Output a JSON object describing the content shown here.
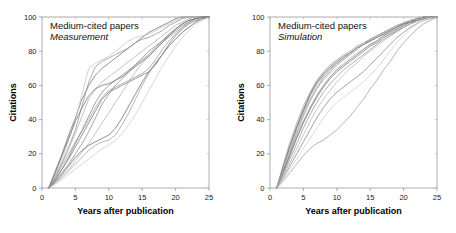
{
  "figure": {
    "background": "#ffffff",
    "width": 456,
    "height": 233
  },
  "chart_data": [
    {
      "type": "line",
      "panel_id": "left",
      "title": "Medium-cited papers",
      "subtitle": "Measurement",
      "xlabel": "Years after publication",
      "ylabel": "Citations",
      "xlim": [
        0,
        25
      ],
      "ylim": [
        0,
        100
      ],
      "xticks": [
        0,
        5,
        10,
        15,
        20,
        25
      ],
      "yticks": [
        0,
        20,
        40,
        60,
        80,
        100
      ],
      "xtick_labels": [
        "0",
        "5",
        "10",
        "15",
        "20",
        "25"
      ],
      "ytick_labels": [
        "0",
        "20",
        "40",
        "60",
        "80",
        "100"
      ],
      "grid": false,
      "legend": "none",
      "line_color_range": [
        "#5a5a5a",
        "#c9c9c9"
      ],
      "x": [
        1,
        2,
        3,
        4,
        5,
        6,
        7,
        8,
        9,
        10,
        11,
        12,
        13,
        14,
        15,
        16,
        17,
        18,
        19,
        20,
        21,
        22,
        23,
        24,
        25
      ],
      "series": [
        {
          "name": "paper-1",
          "color": "#6f6f6f",
          "values": [
            0,
            10,
            20,
            31,
            41,
            52,
            60,
            66,
            70,
            73,
            76,
            79,
            82,
            85,
            88,
            91,
            93,
            95,
            97,
            99,
            100,
            100,
            100,
            100,
            100
          ]
        },
        {
          "name": "paper-2",
          "color": "#8f8f8f",
          "values": [
            0,
            7,
            15,
            24,
            34,
            48,
            62,
            71,
            74,
            76,
            78,
            80,
            82,
            85,
            87,
            88,
            90,
            92,
            95,
            97,
            99,
            100,
            100,
            100,
            100
          ]
        },
        {
          "name": "paper-3",
          "color": "#c2c2c2",
          "values": [
            0,
            8,
            17,
            28,
            40,
            55,
            70,
            73,
            75,
            77,
            80,
            83,
            86,
            88,
            89,
            90,
            92,
            94,
            96,
            98,
            99,
            100,
            100,
            100,
            100
          ]
        },
        {
          "name": "paper-4",
          "color": "#757575",
          "values": [
            0,
            5,
            11,
            17,
            24,
            31,
            38,
            45,
            52,
            56,
            58,
            60,
            62,
            64,
            66,
            68,
            72,
            78,
            84,
            89,
            93,
            96,
            98,
            99,
            100
          ]
        },
        {
          "name": "paper-5",
          "color": "#9a9a9a",
          "values": [
            0,
            6,
            13,
            20,
            27,
            33,
            40,
            47,
            53,
            57,
            59,
            61,
            63,
            65,
            67,
            70,
            75,
            81,
            86,
            90,
            94,
            97,
            99,
            100,
            100
          ]
        },
        {
          "name": "paper-6",
          "color": "#858585",
          "values": [
            0,
            4,
            9,
            14,
            20,
            26,
            33,
            41,
            49,
            55,
            60,
            64,
            68,
            72,
            76,
            80,
            83,
            86,
            89,
            92,
            95,
            97,
            99,
            100,
            100
          ]
        },
        {
          "name": "paper-7",
          "color": "#b0b0b0",
          "values": [
            0,
            3,
            7,
            11,
            16,
            21,
            26,
            32,
            38,
            44,
            50,
            56,
            62,
            68,
            73,
            77,
            81,
            85,
            88,
            91,
            94,
            96,
            98,
            99,
            100
          ]
        },
        {
          "name": "paper-8",
          "color": "#6a6a6a",
          "values": [
            0,
            4,
            8,
            13,
            18,
            22,
            25,
            27,
            29,
            31,
            35,
            41,
            48,
            55,
            62,
            68,
            73,
            78,
            83,
            87,
            91,
            94,
            97,
            99,
            100
          ]
        },
        {
          "name": "paper-9",
          "color": "#9f9f9f",
          "values": [
            0,
            3,
            6,
            10,
            14,
            18,
            22,
            25,
            27,
            28,
            31,
            37,
            44,
            52,
            60,
            67,
            73,
            78,
            83,
            87,
            91,
            94,
            97,
            99,
            100
          ]
        },
        {
          "name": "paper-10",
          "color": "#cacaca",
          "values": [
            0,
            2,
            5,
            8,
            11,
            14,
            17,
            20,
            23,
            25,
            28,
            32,
            37,
            43,
            50,
            57,
            64,
            71,
            77,
            83,
            88,
            92,
            96,
            98,
            100
          ]
        },
        {
          "name": "paper-11",
          "color": "#808080",
          "values": [
            0,
            5,
            11,
            18,
            26,
            34,
            42,
            50,
            56,
            60,
            63,
            66,
            69,
            72,
            75,
            78,
            82,
            86,
            90,
            93,
            96,
            98,
            99,
            100,
            100
          ]
        },
        {
          "name": "paper-12",
          "color": "#adadad",
          "values": [
            0,
            6,
            14,
            23,
            32,
            42,
            52,
            58,
            62,
            65,
            68,
            71,
            74,
            77,
            80,
            83,
            86,
            89,
            92,
            95,
            97,
            99,
            100,
            100,
            100
          ]
        },
        {
          "name": "paper-13",
          "color": "#707070",
          "values": [
            0,
            9,
            19,
            29,
            39,
            47,
            54,
            58,
            60,
            61,
            63,
            65,
            68,
            71,
            74,
            77,
            81,
            85,
            89,
            93,
            96,
            98,
            99,
            100,
            100
          ]
        }
      ]
    },
    {
      "type": "line",
      "panel_id": "right",
      "title": "Medium-cited papers",
      "subtitle": "Simulation",
      "xlabel": "Years after publication",
      "ylabel": "Citations",
      "xlim": [
        0,
        25
      ],
      "ylim": [
        0,
        100
      ],
      "xticks": [
        0,
        5,
        10,
        15,
        20,
        25
      ],
      "yticks": [
        0,
        20,
        40,
        60,
        80,
        100
      ],
      "xtick_labels": [
        "0",
        "5",
        "10",
        "15",
        "20",
        "25"
      ],
      "ytick_labels": [
        "0",
        "20",
        "40",
        "60",
        "80",
        "100"
      ],
      "grid": false,
      "legend": "none",
      "line_color_range": [
        "#5a5a5a",
        "#c9c9c9"
      ],
      "x": [
        1,
        2,
        3,
        4,
        5,
        6,
        7,
        8,
        9,
        10,
        11,
        12,
        13,
        14,
        15,
        16,
        17,
        18,
        19,
        20,
        21,
        22,
        23,
        24,
        25
      ],
      "series": [
        {
          "name": "sim-1",
          "color": "#6f6f6f",
          "values": [
            0,
            12,
            24,
            35,
            45,
            54,
            61,
            66,
            70,
            73,
            76,
            79,
            82,
            84,
            87,
            89,
            91,
            93,
            95,
            96,
            98,
            99,
            100,
            100,
            100
          ]
        },
        {
          "name": "sim-2",
          "color": "#8a8a8a",
          "values": [
            0,
            10,
            21,
            32,
            42,
            51,
            58,
            64,
            68,
            72,
            75,
            78,
            81,
            84,
            86,
            88,
            90,
            92,
            94,
            96,
            97,
            99,
            100,
            100,
            100
          ]
        },
        {
          "name": "sim-3",
          "color": "#a8a8a8",
          "values": [
            0,
            14,
            27,
            38,
            48,
            56,
            63,
            68,
            72,
            75,
            78,
            80,
            83,
            85,
            87,
            89,
            91,
            93,
            95,
            96,
            98,
            99,
            100,
            100,
            100
          ]
        },
        {
          "name": "sim-4",
          "color": "#777777",
          "values": [
            0,
            9,
            19,
            29,
            38,
            46,
            53,
            59,
            64,
            68,
            71,
            74,
            77,
            80,
            83,
            85,
            88,
            90,
            92,
            94,
            96,
            98,
            99,
            100,
            100
          ]
        },
        {
          "name": "sim-5",
          "color": "#c4c4c4",
          "values": [
            0,
            11,
            22,
            33,
            43,
            51,
            58,
            63,
            67,
            70,
            73,
            76,
            79,
            81,
            84,
            86,
            89,
            91,
            93,
            95,
            97,
            98,
            99,
            100,
            100
          ]
        },
        {
          "name": "sim-6",
          "color": "#949494",
          "values": [
            0,
            8,
            17,
            26,
            35,
            43,
            50,
            56,
            61,
            65,
            69,
            72,
            75,
            78,
            81,
            84,
            87,
            89,
            92,
            94,
            96,
            98,
            99,
            100,
            100
          ]
        },
        {
          "name": "sim-7",
          "color": "#696969",
          "values": [
            0,
            13,
            25,
            36,
            46,
            55,
            62,
            67,
            71,
            74,
            77,
            79,
            82,
            84,
            86,
            88,
            90,
            92,
            94,
            96,
            97,
            99,
            100,
            100,
            100
          ]
        },
        {
          "name": "sim-8",
          "color": "#b6b6b6",
          "values": [
            0,
            7,
            15,
            23,
            31,
            39,
            46,
            52,
            57,
            62,
            66,
            70,
            73,
            77,
            80,
            83,
            86,
            89,
            91,
            94,
            96,
            97,
            99,
            100,
            100
          ]
        },
        {
          "name": "sim-9",
          "color": "#848484",
          "values": [
            0,
            6,
            13,
            20,
            27,
            34,
            41,
            47,
            52,
            56,
            59,
            62,
            65,
            68,
            72,
            76,
            80,
            84,
            88,
            91,
            94,
            96,
            98,
            99,
            100
          ]
        },
        {
          "name": "sim-10",
          "color": "#cfcfcf",
          "values": [
            0,
            5,
            11,
            17,
            23,
            29,
            35,
            41,
            46,
            50,
            53,
            56,
            59,
            62,
            66,
            70,
            75,
            80,
            85,
            89,
            93,
            96,
            98,
            99,
            100
          ]
        },
        {
          "name": "sim-11",
          "color": "#9e9e9e",
          "values": [
            0,
            4,
            9,
            14,
            19,
            23,
            26,
            28,
            31,
            34,
            38,
            42,
            47,
            52,
            58,
            63,
            69,
            74,
            80,
            85,
            89,
            93,
            96,
            98,
            100
          ]
        },
        {
          "name": "sim-12",
          "color": "#7d7d7d",
          "values": [
            0,
            10,
            20,
            30,
            39,
            47,
            54,
            60,
            65,
            69,
            72,
            75,
            78,
            81,
            84,
            86,
            89,
            91,
            93,
            95,
            97,
            98,
            99,
            100,
            100
          ]
        },
        {
          "name": "sim-13",
          "color": "#adadad",
          "values": [
            0,
            12,
            23,
            34,
            44,
            52,
            59,
            65,
            69,
            73,
            76,
            79,
            82,
            84,
            87,
            89,
            91,
            93,
            95,
            97,
            98,
            99,
            100,
            100,
            100
          ]
        }
      ]
    }
  ]
}
